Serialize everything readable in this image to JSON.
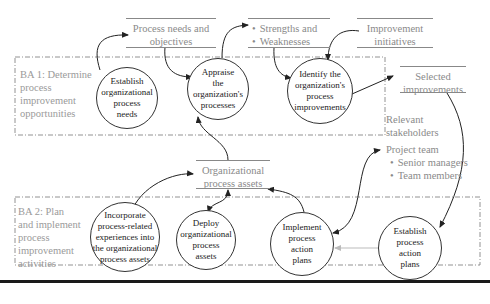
{
  "diagram": {
    "areas": [
      {
        "id": "ba1",
        "label_lines": [
          "BA 1: Determine",
          "process",
          "improvement",
          "opportunities"
        ]
      },
      {
        "id": "ba2",
        "label_lines": [
          "BA 2: Plan",
          "and implement",
          "process",
          "improvement",
          "activities"
        ]
      }
    ],
    "stores": [
      {
        "id": "process-needs",
        "lines": [
          "Process needs and",
          "objectives"
        ]
      },
      {
        "id": "strengths-weaknesses",
        "lines": [
          "Strengths and",
          "Weaknesses"
        ],
        "bulleted": true
      },
      {
        "id": "improvement-initiatives",
        "lines": [
          "Improvement",
          "initiatives"
        ]
      },
      {
        "id": "selected-improvements",
        "lines": [
          "Selected",
          "improvements"
        ]
      },
      {
        "id": "org-process-assets",
        "lines": [
          "Organizational",
          "process assets"
        ]
      }
    ],
    "processes": [
      {
        "id": "establish-needs",
        "lines": [
          "Establish",
          "organizational",
          "process",
          "needs"
        ]
      },
      {
        "id": "appraise",
        "lines": [
          "Appraise",
          "the",
          "organization's",
          "processes"
        ]
      },
      {
        "id": "identify",
        "lines": [
          "Identify the",
          "organization's",
          "process",
          "improvements"
        ]
      },
      {
        "id": "incorporate",
        "lines": [
          "Incorporate",
          "process-related",
          "experiences into",
          "the organizational",
          "process assets"
        ]
      },
      {
        "id": "deploy",
        "lines": [
          "Deploy",
          "organizational",
          "process",
          "assets"
        ]
      },
      {
        "id": "implement",
        "lines": [
          "Implement",
          "process",
          "action",
          "plans"
        ]
      },
      {
        "id": "establish-plans",
        "lines": [
          "Establish",
          "process",
          "action",
          "plans"
        ]
      }
    ],
    "stakeholders": {
      "title_lines": [
        "Relevant",
        "stakeholders"
      ],
      "group": "Project team",
      "members": [
        "Senior managers",
        "Team members"
      ]
    },
    "colors": {
      "stroke": "#333333",
      "label_gray": "#8a8a8a",
      "dashed": "#666666",
      "light_arrow": "#bbbbbb"
    }
  }
}
